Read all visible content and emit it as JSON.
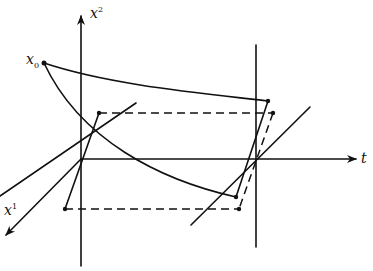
{
  "diagram": {
    "labels": {
      "x2_axis": {
        "base": "x",
        "sup": "2"
      },
      "x1_axis": {
        "base": "x",
        "sup": "1"
      },
      "t_axis": "t",
      "x0_point": {
        "base": "x",
        "sub": "0"
      }
    },
    "colors": {
      "ink": "#111111",
      "background": "#ffffff"
    },
    "elements": [
      "vertical axis x^2 with arrow",
      "horizontal axis t with arrow",
      "oblique axis x^1 with arrow",
      "vertical line at t = T",
      "point x0 with two curves to the t = T plane",
      "dashed parallelogram between planes",
      "solid segments in t = 0 and t = T planes"
    ]
  }
}
